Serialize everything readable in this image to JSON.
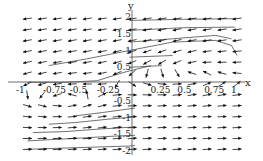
{
  "chart_data": {
    "type": "vector_field",
    "title": "",
    "xlabel": "x",
    "ylabel": "y",
    "xlim": [
      -1,
      1
    ],
    "ylim": [
      -2,
      2
    ],
    "grid": false,
    "x_ticks": [
      {
        "value": -1,
        "label": "-1"
      },
      {
        "value": -0.75,
        "label": "-0.75"
      },
      {
        "value": -0.5,
        "label": "-0.5"
      },
      {
        "value": -0.25,
        "label": "-0.25"
      },
      {
        "value": 0.25,
        "label": "0.25"
      },
      {
        "value": 0.5,
        "label": "0.5"
      },
      {
        "value": 0.75,
        "label": "0.75"
      },
      {
        "value": 1,
        "label": "1"
      }
    ],
    "y_ticks": [
      {
        "value": 2,
        "label": "2"
      },
      {
        "value": 1.5,
        "label": "1.5"
      },
      {
        "value": 1,
        "label": "1"
      },
      {
        "value": 0.5,
        "label": "0.5"
      },
      {
        "value": -0.5,
        "label": "-0.5"
      },
      {
        "value": -1,
        "label": "-1"
      },
      {
        "value": -1.5,
        "label": "-1.5"
      },
      {
        "value": -2,
        "label": "-2"
      }
    ],
    "field": {
      "description": "Direction field: arrows point left/down in upper half, right/up in lower half; circulation around a center near (-0.65,-0.75) in lower left and around (0.55,0.55) in upper right",
      "columns": 15,
      "rows": 13,
      "x_range": [
        -0.95,
        1.0
      ],
      "y_range": [
        -1.95,
        1.95
      ],
      "arrow_length_px": 9
    },
    "streamlines": [
      {
        "points": [
          [
            -0.95,
            -1.95
          ],
          [
            -0.5,
            -1.9
          ],
          [
            0,
            -1.85
          ],
          [
            0.05,
            -1.84
          ]
        ]
      },
      {
        "points": [
          [
            -0.95,
            -1.7
          ],
          [
            -0.5,
            -1.62
          ],
          [
            -0.1,
            -1.55
          ],
          [
            0.05,
            -1.53
          ]
        ]
      },
      {
        "points": [
          [
            -0.9,
            -1.45
          ],
          [
            -0.6,
            -1.42
          ],
          [
            -0.3,
            -1.35
          ],
          [
            0.05,
            -1.28
          ]
        ]
      },
      {
        "points": [
          [
            -0.75,
            -1.2
          ],
          [
            -0.5,
            -1.15
          ],
          [
            -0.2,
            -1.05
          ],
          [
            0.05,
            -0.98
          ]
        ]
      },
      {
        "points": [
          [
            -0.5,
            -0.95
          ],
          [
            -0.25,
            -0.85
          ],
          [
            0.05,
            -0.72
          ]
        ]
      },
      {
        "points": [
          [
            -0.95,
            0.05
          ],
          [
            -0.6,
            0.05
          ],
          [
            -0.3,
            0.1
          ],
          [
            -0.05,
            0.35
          ],
          [
            0.2,
            0.55
          ]
        ]
      },
      {
        "points": [
          [
            -0.75,
            0.55
          ],
          [
            -0.4,
            0.75
          ],
          [
            0,
            1.0
          ],
          [
            0.4,
            1.25
          ],
          [
            0.8,
            1.3
          ],
          [
            0.95,
            1.15
          ],
          [
            1.0,
            0.85
          ]
        ]
      },
      {
        "points": [
          [
            0.0,
            0.5
          ],
          [
            0.3,
            0.55
          ]
        ]
      },
      {
        "points": [
          [
            0.0,
            0.8
          ],
          [
            0.4,
            0.85
          ]
        ]
      },
      {
        "points": [
          [
            0.0,
            1.25
          ],
          [
            0.4,
            1.35
          ],
          [
            0.8,
            1.45
          ],
          [
            0.95,
            1.35
          ]
        ]
      },
      {
        "points": [
          [
            0.0,
            1.6
          ],
          [
            0.5,
            1.68
          ],
          [
            0.98,
            1.7
          ]
        ]
      },
      {
        "points": [
          [
            0.0,
            1.9
          ],
          [
            0.5,
            1.93
          ],
          [
            0.98,
            1.95
          ]
        ]
      }
    ]
  },
  "colors": {
    "axis": "#444444",
    "arrow": "#111111",
    "streamline": "#333333",
    "background": "#ffffff"
  }
}
